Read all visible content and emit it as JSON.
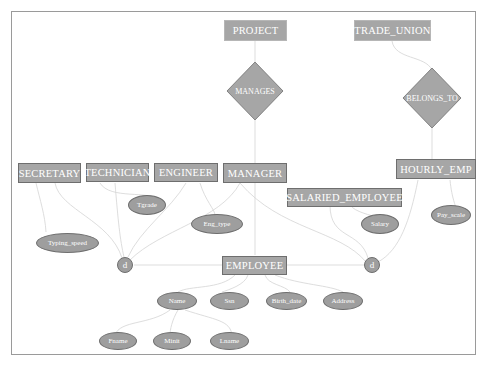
{
  "diagram": {
    "type": "EER diagram",
    "entities": {
      "project": "PROJECT",
      "trade_union": "TRADE_UNION",
      "secretary": "SECRETARY",
      "technician": "TECHNICIAN",
      "engineer": "ENGINEER",
      "manager": "MANAGER",
      "hourly_emp": "HOURLY_EMP",
      "salaried_employee": "SALARIED_EMPLOYEE",
      "employee": "EMPLOYEE"
    },
    "relationships": {
      "manages": "MANAGES",
      "belongs_to": "BELONGS_TO"
    },
    "attributes": {
      "tgrade": "Tgrade",
      "typing_speed": "Typing_speed",
      "eng_type": "Eng_type",
      "salary": "Salary",
      "pay_scale": "Pay_scale",
      "name": "Name",
      "ssn": "Ssn",
      "birth_date": "Birth_date",
      "address": "Address",
      "fname": "Fname",
      "minit": "Minit",
      "lname": "Lname"
    },
    "specializations": {
      "left": "d",
      "right": "d"
    },
    "colors": {
      "shape_fill": "#a6a6a6",
      "shape_border": "#6e6e6e",
      "text": "#ffffff",
      "edge": "#d0d0d0",
      "frame": "#9a9a9a"
    }
  }
}
